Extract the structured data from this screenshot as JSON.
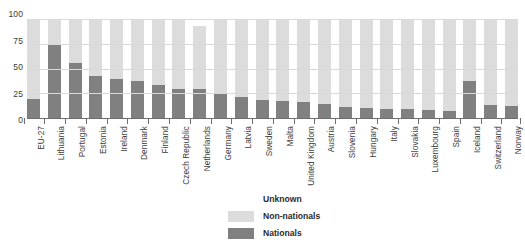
{
  "chart_data": {
    "type": "bar",
    "stacked": true,
    "title": "",
    "subtitle": "",
    "xlabel": "",
    "ylabel": "",
    "ylim": [
      0,
      100
    ],
    "yticks": [
      0,
      25,
      50,
      75,
      100
    ],
    "ytick_labels": [
      "0",
      "25",
      "50",
      "75",
      "100"
    ],
    "grid": true,
    "legend_position": "bottom-center",
    "categories": [
      "EU-27",
      "Lithuania",
      "Portugal",
      "Estonia",
      "Ireland",
      "Denmark",
      "Finland",
      "Czech Republic",
      "Netherlands",
      "Germany",
      "Latvia",
      "Sweden",
      "Malta",
      "United Kingdom",
      "Austria",
      "Slovenia",
      "Hungary",
      "Italy",
      "Slovakia",
      "Luxembourg",
      "Spain",
      "Iceland",
      "Switzerland",
      "Norway"
    ],
    "series": [
      {
        "name": "Nationals",
        "color": "#808080",
        "values": [
          19,
          75,
          56,
          42,
          39,
          37,
          33,
          29,
          29,
          24,
          21,
          18,
          17,
          16,
          14,
          11,
          10,
          9,
          9,
          8,
          7,
          37,
          13,
          12
        ]
      },
      {
        "name": "Non-nationals",
        "color": "#dcdcdc",
        "values": [
          81,
          25,
          44,
          58,
          61,
          63,
          67,
          71,
          64,
          76,
          79,
          82,
          83,
          84,
          86,
          89,
          90,
          91,
          91,
          92,
          93,
          63,
          87,
          88
        ]
      },
      {
        "name": "Unknown",
        "color": "#ffffff",
        "values": [
          0,
          0,
          0,
          0,
          0,
          0,
          0,
          0,
          7,
          0,
          0,
          0,
          0,
          0,
          0,
          0,
          0,
          0,
          0,
          0,
          0,
          0,
          0,
          0
        ]
      }
    ]
  },
  "legend": {
    "items": [
      {
        "label": "Unknown",
        "color": "#ffffff"
      },
      {
        "label": "Non-nationals",
        "color": "#dcdcdc"
      },
      {
        "label": "Nationals",
        "color": "#808080"
      }
    ]
  }
}
